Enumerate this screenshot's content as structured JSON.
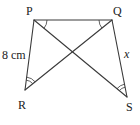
{
  "diagram": {
    "type": "geometry",
    "points": {
      "P": {
        "label": "P",
        "x": 34,
        "y": 20
      },
      "Q": {
        "label": "Q",
        "x": 112,
        "y": 20
      },
      "R": {
        "label": "R",
        "x": 25,
        "y": 90
      },
      "S": {
        "label": "S",
        "x": 127,
        "y": 97
      }
    },
    "segments": [
      "PQ",
      "PR",
      "QS",
      "PS",
      "QR"
    ],
    "side_labels": {
      "PR": "8 cm",
      "QS": "x"
    },
    "angle_marks": {
      "single_arc": [
        "angle QPS at P",
        "angle PQR at Q"
      ],
      "double_arc": [
        "angle PRQ at R",
        "angle QSP at S"
      ]
    }
  }
}
